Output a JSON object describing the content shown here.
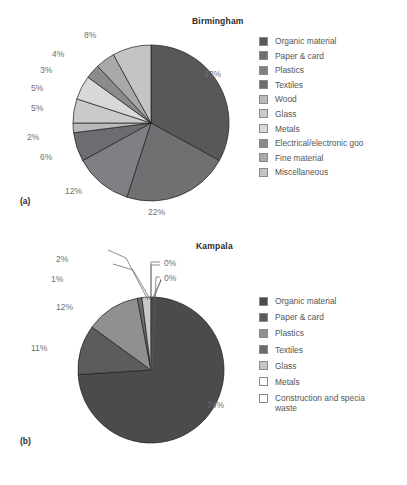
{
  "figure": {
    "caption": "",
    "panels": [
      {
        "id": "a",
        "label": "(a)"
      },
      {
        "id": "b",
        "label": "(b)"
      }
    ]
  },
  "chart_data": [
    {
      "type": "pie",
      "title": "Birmingham",
      "panel": "(a)",
      "legend_position": "right",
      "categories": [
        "Organic material",
        "Paper & card",
        "Plastics",
        "Textiles",
        "Wood",
        "Glass",
        "Metals",
        "Electrical/electronic goo",
        "Fine material",
        "Miscellaneous"
      ],
      "values": [
        33,
        22,
        12,
        6,
        2,
        5,
        5,
        3,
        4,
        8
      ],
      "labels": [
        "33%",
        "22%",
        "12%",
        "6%",
        "2%",
        "5%",
        "5%",
        "3%",
        "4%",
        "8%"
      ],
      "colors": [
        "#58585a",
        "#6f7072",
        "#7f8083",
        "#6c6d70",
        "#b9babb",
        "#c9cacb",
        "#d7d8d9",
        "#8a8b8d",
        "#a8a9ab",
        "#c3c4c5"
      ],
      "label_positions": [
        {
          "x": 204,
          "y": 69
        },
        {
          "x": 148,
          "y": 207
        },
        {
          "x": 65,
          "y": 186
        },
        {
          "x": 40,
          "y": 152
        },
        {
          "x": 27,
          "y": 132
        },
        {
          "x": 31,
          "y": 103
        },
        {
          "x": 31,
          "y": 83
        },
        {
          "x": 40,
          "y": 65
        },
        {
          "x": 52,
          "y": 49
        },
        {
          "x": 84,
          "y": 30
        }
      ]
    },
    {
      "type": "pie",
      "title": "Kampala",
      "panel": "(b)",
      "legend_position": "right",
      "categories": [
        "Organic material",
        "Paper & card",
        "Plastics",
        "Textiles",
        "Glass",
        "Metals",
        "Construction and specia\nwaste"
      ],
      "values": [
        74,
        11,
        12,
        1,
        2,
        0,
        0
      ],
      "labels": [
        "74%",
        "11%",
        "12%",
        "1%",
        "2%",
        "0%",
        "0%"
      ],
      "colors": [
        "#4a4b4d",
        "#5b5c5e",
        "#8f9092",
        "#6a6b6d",
        "#c6c7c8",
        "#ffffff",
        "#ffffff"
      ],
      "label_positions": [
        {
          "x": 207,
          "y": 400
        },
        {
          "x": 31,
          "y": 343
        },
        {
          "x": 56,
          "y": 302
        },
        {
          "x": 51,
          "y": 274
        },
        {
          "x": 56,
          "y": 254
        },
        {
          "x": 164,
          "y": 258
        },
        {
          "x": 164,
          "y": 273
        }
      ]
    }
  ]
}
